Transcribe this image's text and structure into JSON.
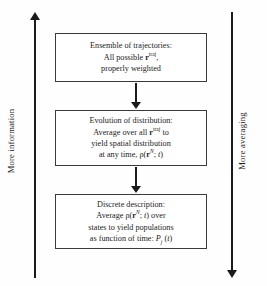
{
  "diagram": {
    "boxes": [
      {
        "id": "ensemble-of-trajectories",
        "lines": [
          {
            "parts": [
              {
                "t": "Ensemble of trajectories:"
              }
            ]
          },
          {
            "parts": [
              {
                "t": "All possible "
              },
              {
                "t": "r",
                "style": "bold-italic"
              },
              {
                "t": "traj",
                "style": "sup"
              },
              {
                "t": ","
              }
            ]
          },
          {
            "parts": [
              {
                "t": "properly weighted"
              }
            ]
          }
        ],
        "plain": "Ensemble of trajectories: All possible r^traj, properly weighted"
      },
      {
        "id": "evolution-of-distribution",
        "lines": [
          {
            "parts": [
              {
                "t": "Evolution of distribution:"
              }
            ]
          },
          {
            "parts": [
              {
                "t": "Average over all "
              },
              {
                "t": "r",
                "style": "bold-italic"
              },
              {
                "t": "traj",
                "style": "sup"
              },
              {
                "t": " to"
              }
            ]
          },
          {
            "parts": [
              {
                "t": "yield spatial distribution"
              }
            ]
          },
          {
            "parts": [
              {
                "t": "at any time, ρ("
              },
              {
                "t": "r",
                "style": "bold-italic"
              },
              {
                "t": "N",
                "style": "sup-italic"
              },
              {
                "t": "; "
              },
              {
                "t": "t",
                "style": "italic"
              },
              {
                "t": ")"
              }
            ]
          }
        ],
        "plain": "Evolution of distribution: Average over all r^traj to yield spatial distribution at any time, ρ(r^N; t)"
      },
      {
        "id": "discrete-description",
        "lines": [
          {
            "parts": [
              {
                "t": "Discrete description:"
              }
            ]
          },
          {
            "parts": [
              {
                "t": "Average ρ("
              },
              {
                "t": "r",
                "style": "bold-italic"
              },
              {
                "t": "N",
                "style": "sup-italic"
              },
              {
                "t": "; "
              },
              {
                "t": "t",
                "style": "italic"
              },
              {
                "t": ") over"
              }
            ]
          },
          {
            "parts": [
              {
                "t": "states to yield populations"
              }
            ]
          },
          {
            "parts": [
              {
                "t": "as function of time: "
              },
              {
                "t": "P",
                "style": "italic"
              },
              {
                "t": "j",
                "style": "sub-italic"
              },
              {
                "t": " ("
              },
              {
                "t": "t",
                "style": "italic"
              },
              {
                "t": ")"
              }
            ]
          }
        ],
        "plain": "Discrete description: Average ρ(r^N; t) over states to yield populations as function of time: P_j(t)"
      }
    ],
    "connectors": [
      {
        "id": "arrow-box1-to-box2",
        "direction": "down"
      },
      {
        "id": "arrow-box2-to-box3",
        "direction": "down"
      }
    ],
    "axes": {
      "left": {
        "label": "More information",
        "direction": "up",
        "arrow_glyph": "up-arrow-icon"
      },
      "right": {
        "label": "More averaging",
        "direction": "down",
        "arrow_glyph": "down-arrow-icon"
      }
    },
    "colors": {
      "background": "#fefefe",
      "stroke": "#3a3a3a",
      "arrow": "#1a1a1a",
      "text": "#1c1c1c"
    }
  }
}
